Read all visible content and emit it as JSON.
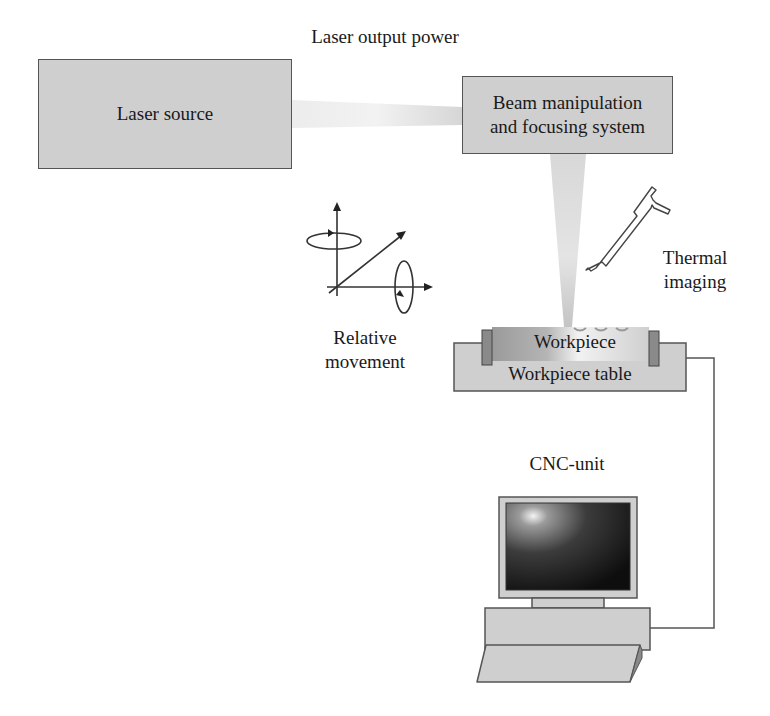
{
  "diagram": {
    "labels": {
      "laser_output_power": "Laser output power",
      "laser_source": "Laser source",
      "beam_system_line1": "Beam manipulation",
      "beam_system_line2": "and focusing system",
      "relative_movement_line1": "Relative",
      "relative_movement_line2": "movement",
      "thermal_imaging_line1": "Thermal",
      "thermal_imaging_line2": "imaging",
      "workpiece": "Workpiece",
      "workpiece_table": "Workpiece table",
      "cnc_unit": "CNC-unit"
    },
    "nodes": [
      {
        "id": "laser_source",
        "label": "Laser source"
      },
      {
        "id": "beam_system",
        "label": "Beam manipulation and focusing system"
      },
      {
        "id": "workpiece",
        "label": "Workpiece"
      },
      {
        "id": "workpiece_table",
        "label": "Workpiece table"
      },
      {
        "id": "thermal_camera",
        "label": "Thermal imaging"
      },
      {
        "id": "motion_axes",
        "label": "Relative movement"
      },
      {
        "id": "cnc_unit",
        "label": "CNC-unit"
      }
    ],
    "edges": [
      {
        "from": "laser_source",
        "to": "beam_system",
        "type": "laser-beam",
        "label": "Laser output power"
      },
      {
        "from": "beam_system",
        "to": "workpiece",
        "type": "focused-beam"
      },
      {
        "from": "workpiece_table",
        "to": "cnc_unit",
        "type": "cable"
      }
    ],
    "colors": {
      "box_fill": "#cfcfcf",
      "box_border": "#555555",
      "beam": "#d9d9d9",
      "screen_dark": "#151515",
      "clamp": "#8a8a8a"
    }
  }
}
